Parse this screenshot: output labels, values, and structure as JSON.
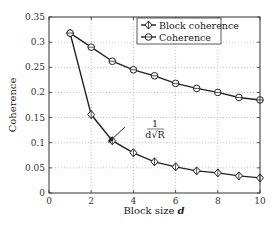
{
  "chart_data": {
    "type": "line",
    "title": "",
    "xlabel": "Block size d",
    "ylabel": "Coherence",
    "xlim": [
      0,
      10
    ],
    "ylim": [
      0,
      0.35
    ],
    "xticks": [
      0,
      2,
      4,
      6,
      8,
      10
    ],
    "xtick_labels": [
      "0",
      "2",
      "4",
      "6",
      "8",
      "10"
    ],
    "yticks": [
      0,
      0.05,
      0.1,
      0.15,
      0.2,
      0.25,
      0.3,
      0.35
    ],
    "ytick_labels": [
      "0",
      "0.05",
      "0.1",
      "0.15",
      "0.2",
      "0.25",
      "0.3",
      "0.35"
    ],
    "grid": true,
    "legend_position": "upper right",
    "x": [
      1,
      2,
      3,
      4,
      5,
      6,
      7,
      8,
      9,
      10
    ],
    "series": [
      {
        "name": "Block coherence",
        "marker": "diamond",
        "values": [
          0.318,
          0.156,
          0.104,
          0.08,
          0.062,
          0.052,
          0.044,
          0.04,
          0.034,
          0.03
        ]
      },
      {
        "name": "Coherence",
        "marker": "circle",
        "values": [
          0.318,
          0.29,
          0.262,
          0.245,
          0.233,
          0.218,
          0.208,
          0.2,
          0.19,
          0.185
        ]
      }
    ],
    "annotations": [
      {
        "text": "1/(d√R)",
        "numerator": "1",
        "denominator": "d√R",
        "arrow_to_x": 3.5,
        "arrow_to_y": 0.092
      }
    ]
  }
}
